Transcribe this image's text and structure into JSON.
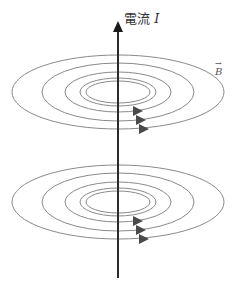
{
  "diagram": {
    "current_label": {
      "text": "電流",
      "variable": "I"
    },
    "field_label": {
      "vector_mark": "→",
      "variable": "B"
    },
    "colors": {
      "wire": "#2b2b2b",
      "field_lines": "#8a8a8a",
      "arrows": "#4a4a4a"
    },
    "ring_sets": [
      {
        "center_y": 92,
        "ellipses": [
          [
            106,
            37
          ],
          [
            76,
            29
          ],
          [
            53,
            20
          ],
          [
            38,
            14
          ],
          [
            32,
            11
          ]
        ],
        "arrow_ys": [
          111,
          120,
          129
        ]
      },
      {
        "center_y": 202,
        "ellipses": [
          [
            106,
            37
          ],
          [
            76,
            29
          ],
          [
            53,
            20
          ],
          [
            38,
            14
          ],
          [
            32,
            11
          ]
        ],
        "arrow_ys": [
          221,
          230,
          239
        ]
      }
    ]
  }
}
